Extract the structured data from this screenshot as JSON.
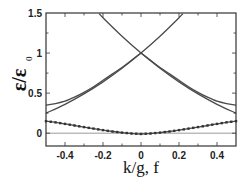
{
  "chart_data": {
    "type": "line",
    "title": "",
    "xlabel": "k/g, f",
    "ylabel": "ε/ε₀",
    "xlim": [
      -0.5,
      0.5
    ],
    "ylim": [
      -0.16,
      1.5
    ],
    "x_ticks": [
      "-0.4",
      "-0.2",
      "0",
      "0.2",
      "0.4"
    ],
    "x_tick_values": [
      -0.4,
      -0.2,
      0,
      0.2,
      0.4
    ],
    "y_ticks": [
      "0",
      "0.5",
      "1",
      "1.5"
    ],
    "y_tick_values": [
      0,
      0.5,
      1,
      1.5
    ],
    "grid": false,
    "reference_line": {
      "y": 0,
      "color": "#9a9a9a"
    },
    "series": [
      {
        "name": "band 1 (lower, with markers)",
        "markers": true,
        "x": [
          -0.5,
          -0.45,
          -0.4,
          -0.35,
          -0.3,
          -0.25,
          -0.2,
          -0.15,
          -0.1,
          -0.05,
          0,
          0.05,
          0.1,
          0.15,
          0.2,
          0.25,
          0.3,
          0.35,
          0.4,
          0.45,
          0.5
        ],
        "values": [
          0.15,
          0.135,
          0.116,
          0.096,
          0.076,
          0.057,
          0.038,
          0.021,
          0.007,
          -0.004,
          -0.01,
          -0.004,
          0.007,
          0.021,
          0.038,
          0.057,
          0.076,
          0.096,
          0.116,
          0.135,
          0.15
        ]
      },
      {
        "name": "band 2 (upper)",
        "markers": false,
        "x": [
          -0.5,
          -0.45,
          -0.4,
          -0.35,
          -0.3,
          -0.25,
          -0.2,
          -0.15,
          -0.1,
          -0.05,
          0
        ],
        "values": [
          0.35,
          0.37,
          0.4,
          0.45,
          0.51,
          0.58,
          0.66,
          0.74,
          0.82,
          0.91,
          1.0
        ]
      },
      {
        "name": "band 2 (upper, right)",
        "markers": false,
        "x": [
          0,
          0.05,
          0.1,
          0.15,
          0.2,
          0.25,
          0.3,
          0.35,
          0.4,
          0.45,
          0.5
        ],
        "values": [
          1.0,
          0.91,
          0.82,
          0.74,
          0.66,
          0.58,
          0.51,
          0.45,
          0.4,
          0.37,
          0.35
        ]
      },
      {
        "name": "band 3 (rising)",
        "markers": false,
        "x": [
          -0.5,
          -0.4,
          -0.3,
          -0.2,
          -0.1,
          0,
          0.1,
          0.2,
          0.22
        ],
        "values": [
          0.25,
          0.36,
          0.49,
          0.64,
          0.81,
          1.0,
          1.21,
          1.44,
          1.49
        ]
      },
      {
        "name": "band 3 (falling)",
        "markers": false,
        "x": [
          -0.22,
          -0.2,
          -0.1,
          0,
          0.1,
          0.2,
          0.3,
          0.4,
          0.5
        ],
        "values": [
          1.49,
          1.44,
          1.21,
          1.0,
          0.81,
          0.64,
          0.49,
          0.36,
          0.25
        ]
      }
    ]
  },
  "axes": {
    "xlabel": "k/g, f",
    "ylabel_main": "ε/ε",
    "ylabel_sub": "0"
  }
}
